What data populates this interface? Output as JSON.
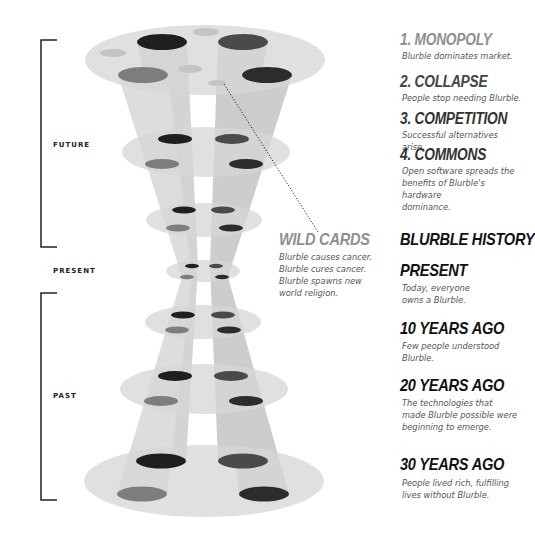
{
  "timeline": {
    "future_label": "FUTURE",
    "present_label": "PRESENT",
    "past_label": "PAST"
  },
  "scenarios": [
    {
      "title": "1. MONOPOLY",
      "text": "Blurble dominates market."
    },
    {
      "title": "2. COLLAPSE",
      "text": "People stop needing Blurble."
    },
    {
      "title": "3. COMPETITION",
      "text": "Successful alternatives arise."
    },
    {
      "title": "4. COMMONS",
      "lines": [
        "Open software spreads the",
        "benefits of Blurble's hardware",
        "dominance."
      ]
    }
  ],
  "wild_cards": {
    "title": "WILD CARDS",
    "lines": [
      "Blurble causes cancer.",
      "Blurble cures cancer.",
      "Blurble spawns new",
      "world religion."
    ]
  },
  "history": {
    "title": "BLURBLE HISTORY",
    "entries": [
      {
        "title": "PRESENT",
        "lines": [
          "Today, everyone",
          "owns a Blurble."
        ]
      },
      {
        "title": "10 YEARS AGO",
        "lines": [
          "Few people understood",
          "Blurble."
        ]
      },
      {
        "title": "20 YEARS AGO",
        "lines": [
          "The technologies that",
          "made Blurble possible were",
          "beginning to emerge."
        ]
      },
      {
        "title": "30 YEARS AGO",
        "lines": [
          "People lived rich, fulfilling",
          "lives without Blurble."
        ]
      }
    ]
  },
  "colors": {
    "disc": "#d8d8d8",
    "beam": "#bdbdbd",
    "spot_dark": "#1f1f1f",
    "spot_mid": "#4a4a4a",
    "spot_gray": "#7d7d7d",
    "spot_light": "#c4c4c4",
    "bracket": "#222222",
    "scenario_gray": "#8f8f8f"
  }
}
